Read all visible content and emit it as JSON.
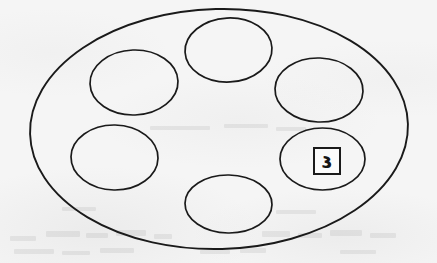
{
  "figure": {
    "media": "scanned line drawing",
    "background_color": "#f5f5f5",
    "ink_color": "#1a1a1a",
    "width": 437,
    "height": 263
  },
  "outer_shape": {
    "name": "outer-ellipse",
    "cx": 219,
    "cy": 129,
    "rx": 189,
    "ry": 120,
    "rotation": -1.5,
    "stroke_width": 1.9
  },
  "inner_shapes": [
    {
      "name": "inner-ellipse-top",
      "position_label": "top",
      "cx": 228.5,
      "cy": 50,
      "rx": 43.5,
      "ry": 32,
      "rotation": -3,
      "stroke_width": 1.7,
      "label": ""
    },
    {
      "name": "inner-ellipse-upper-left",
      "position_label": "upper-left",
      "cx": 134,
      "cy": 82.5,
      "rx": 44,
      "ry": 32.5,
      "rotation": -2,
      "stroke_width": 1.7,
      "label": ""
    },
    {
      "name": "inner-ellipse-upper-right",
      "position_label": "upper-right",
      "cx": 319,
      "cy": 90,
      "rx": 44,
      "ry": 32,
      "rotation": 2,
      "stroke_width": 1.7,
      "label": ""
    },
    {
      "name": "inner-ellipse-lower-left",
      "position_label": "lower-left",
      "cx": 114.5,
      "cy": 157.5,
      "rx": 43.5,
      "ry": 32.5,
      "rotation": 1,
      "stroke_width": 1.7,
      "label": ""
    },
    {
      "name": "inner-ellipse-lower-right",
      "position_label": "lower-right",
      "cx": 322.5,
      "cy": 159,
      "rx": 42.5,
      "ry": 31,
      "rotation": 0,
      "stroke_width": 1.7,
      "label": "٤"
    },
    {
      "name": "inner-ellipse-bottom",
      "position_label": "bottom",
      "cx": 228.5,
      "cy": 204,
      "rx": 43.5,
      "ry": 29,
      "rotation": 1,
      "stroke_width": 1.7,
      "label": ""
    }
  ],
  "label_box": {
    "name": "numeral-label-box",
    "value": "٤",
    "value_latin": "3",
    "x": 313,
    "y": 147,
    "size": 28,
    "border_color": "#1a1a1a",
    "text_color": "#151515"
  },
  "ghost_marks": [
    {
      "x": 10,
      "y": 236,
      "w": 26,
      "h": 5
    },
    {
      "x": 46,
      "y": 231,
      "w": 34,
      "h": 6
    },
    {
      "x": 86,
      "y": 233,
      "w": 22,
      "h": 5
    },
    {
      "x": 116,
      "y": 230,
      "w": 30,
      "h": 6
    },
    {
      "x": 154,
      "y": 234,
      "w": 18,
      "h": 5
    },
    {
      "x": 262,
      "y": 231,
      "w": 28,
      "h": 6
    },
    {
      "x": 298,
      "y": 233,
      "w": 24,
      "h": 5
    },
    {
      "x": 330,
      "y": 230,
      "w": 32,
      "h": 6
    },
    {
      "x": 370,
      "y": 233,
      "w": 26,
      "h": 5
    },
    {
      "x": 14,
      "y": 249,
      "w": 40,
      "h": 5
    },
    {
      "x": 62,
      "y": 251,
      "w": 28,
      "h": 4
    },
    {
      "x": 100,
      "y": 248,
      "w": 34,
      "h": 5
    },
    {
      "x": 200,
      "y": 250,
      "w": 30,
      "h": 4
    },
    {
      "x": 240,
      "y": 248,
      "w": 26,
      "h": 5
    },
    {
      "x": 340,
      "y": 250,
      "w": 36,
      "h": 4
    },
    {
      "x": 150,
      "y": 126,
      "w": 60,
      "h": 4
    },
    {
      "x": 224,
      "y": 124,
      "w": 44,
      "h": 4
    },
    {
      "x": 276,
      "y": 127,
      "w": 30,
      "h": 4
    },
    {
      "x": 62,
      "y": 207,
      "w": 34,
      "h": 4
    },
    {
      "x": 276,
      "y": 210,
      "w": 40,
      "h": 4
    }
  ]
}
